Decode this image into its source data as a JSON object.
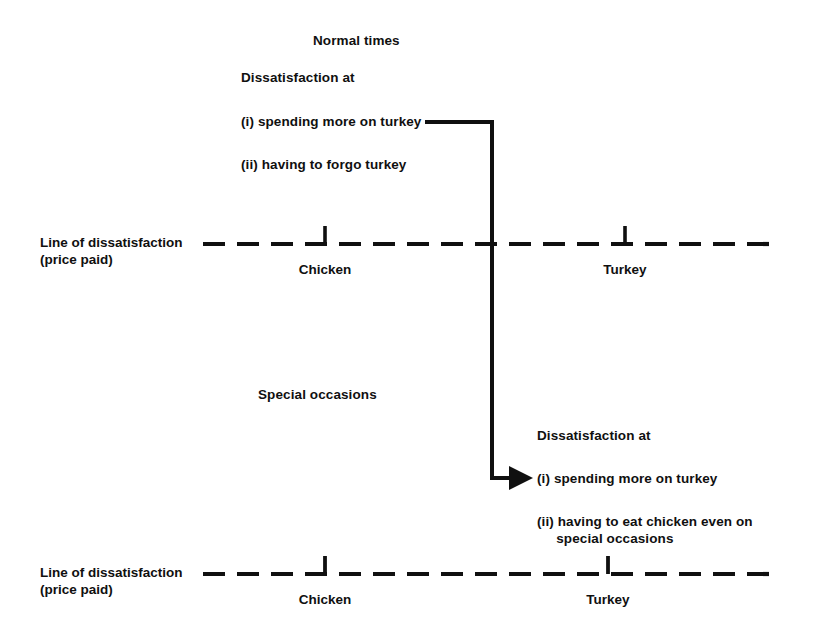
{
  "figure": {
    "panels": [
      {
        "id": "normal-times",
        "heading": "Normal times",
        "callout_heading": "Dissatisfaction at",
        "callout_items": [
          "(i) spending more on turkey",
          "(ii) having to forgo turkey"
        ],
        "axis_label_line1": "Line of dissatisfaction",
        "axis_label_line2": "(price paid)",
        "ticks": [
          {
            "label": "Chicken",
            "x": 325
          },
          {
            "label": "Turkey",
            "x": 625
          }
        ]
      },
      {
        "id": "special-occasions",
        "heading": "Special occasions",
        "callout_heading": "Dissatisfaction at",
        "callout_items": [
          "(i) spending more on turkey",
          "(ii) having to eat chicken even on",
          "     special occasions"
        ],
        "axis_label_line1": "Line of dissatisfaction",
        "axis_label_line2": "(price paid)",
        "ticks": [
          {
            "label": "Chicken",
            "x": 325
          },
          {
            "label": "Turkey",
            "x": 608
          }
        ]
      }
    ],
    "connector": {
      "description": "arrow from normal-times item (i) down to special-occasions item (i)"
    },
    "colors": {
      "ink": "#101010",
      "background": "#ffffff"
    }
  }
}
